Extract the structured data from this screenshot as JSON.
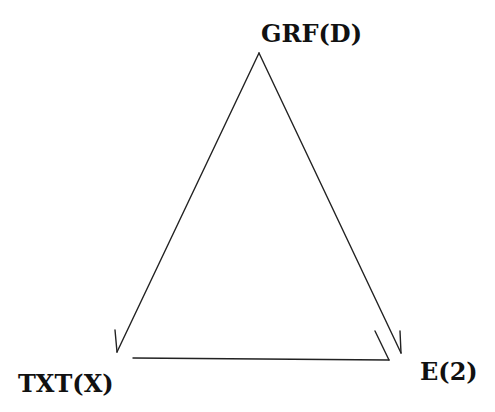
{
  "diagram": {
    "type": "directed-triangle",
    "nodes": [
      {
        "id": "grf",
        "label": "GRF(D)",
        "position": "top"
      },
      {
        "id": "txt",
        "label": "TXT(X)",
        "position": "bottom-left"
      },
      {
        "id": "e",
        "label": "E(2)",
        "position": "bottom-right"
      }
    ],
    "edges": [
      {
        "from": "GRF(D)",
        "to": "TXT(X)",
        "style": "half-arrow"
      },
      {
        "from": "GRF(D)",
        "to": "E(2)",
        "style": "half-arrow"
      },
      {
        "from": "TXT(X)",
        "to": "E(2)",
        "style": "half-arrow"
      }
    ],
    "line_color": "#222222",
    "text_color": "#111111"
  }
}
